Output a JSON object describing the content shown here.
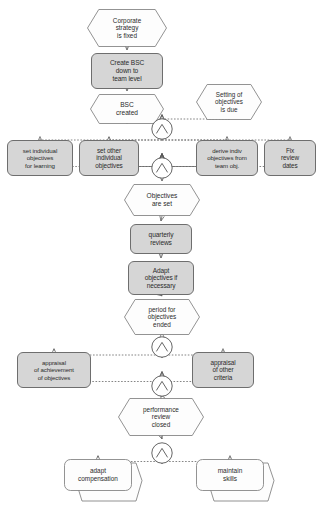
{
  "diagram": {
    "notation": "event-driven-process-chain",
    "canvas": {
      "width": 322,
      "height": 508
    },
    "colors": {
      "background": "#ffffff",
      "event_fill": "#fdfdfd",
      "event_stroke": "#777777",
      "function_fill": "#d6d6d6",
      "function_stroke": "#6e6e6e",
      "process_path_fill": "#fdfdfd",
      "process_path_stroke": "#777777",
      "connector_stroke": "#555555",
      "edge_stroke": "#666666",
      "text": "#2b2b2b"
    },
    "nodes": [
      {
        "id": "e1",
        "type": "event",
        "label": "Corporate\nstrategy\nis fixed",
        "x": 87,
        "y": 9,
        "w": 80,
        "h": 38,
        "font": 6.4
      },
      {
        "id": "f1",
        "type": "function",
        "label": "Create BSC\ndown to\nteam level",
        "x": 91,
        "y": 53,
        "w": 72,
        "h": 36,
        "font": 6.6
      },
      {
        "id": "e2",
        "type": "event",
        "label": "BSC\ncreated",
        "x": 90,
        "y": 94,
        "w": 74,
        "h": 30,
        "font": 6.6
      },
      {
        "id": "e3",
        "type": "event",
        "label": "Setting of\nobjectives\nis due",
        "x": 196,
        "y": 84,
        "w": 66,
        "h": 36,
        "font": 6.3
      },
      {
        "id": "g1",
        "type": "and-gate",
        "label": "AND",
        "x": 151,
        "y": 118,
        "w": 22,
        "h": 22
      },
      {
        "id": "f2",
        "type": "function",
        "label": "set individual\nobjectives\nfor learning",
        "x": 7,
        "y": 140,
        "w": 66,
        "h": 36,
        "font": 6.2
      },
      {
        "id": "f3",
        "type": "function",
        "label": "set other\nindividual\nobjectives",
        "x": 79,
        "y": 140,
        "w": 60,
        "h": 36,
        "font": 6.4
      },
      {
        "id": "f4",
        "type": "function",
        "label": "derive indiv\nobjectives from\nteam obj.",
        "x": 196,
        "y": 140,
        "w": 62,
        "h": 36,
        "font": 6.1
      },
      {
        "id": "f5",
        "type": "function",
        "label": "Fix\nreview\ndates",
        "x": 264,
        "y": 140,
        "w": 52,
        "h": 36,
        "font": 6.4
      },
      {
        "id": "g2",
        "type": "and-gate",
        "label": "AND",
        "x": 151,
        "y": 157,
        "w": 22,
        "h": 22
      },
      {
        "id": "e4",
        "type": "event",
        "label": "Objectives\nare set",
        "x": 124,
        "y": 184,
        "w": 76,
        "h": 32,
        "font": 6.6
      },
      {
        "id": "f6",
        "type": "function",
        "label": "quarterly\nreviews",
        "x": 130,
        "y": 224,
        "w": 62,
        "h": 30,
        "font": 6.6
      },
      {
        "id": "f7",
        "type": "function",
        "label": "Adapt\nobjectives if\nnecessary",
        "x": 128,
        "y": 261,
        "w": 66,
        "h": 34,
        "font": 6.5
      },
      {
        "id": "e5",
        "type": "event",
        "label": "period for\nobjectives\nended",
        "x": 124,
        "y": 299,
        "w": 76,
        "h": 36,
        "font": 6.4
      },
      {
        "id": "g3",
        "type": "and-gate",
        "label": "AND",
        "x": 151,
        "y": 336,
        "w": 22,
        "h": 22
      },
      {
        "id": "f8",
        "type": "function",
        "label": "appraisal\nof achievement\nof objectives",
        "x": 17,
        "y": 352,
        "w": 74,
        "h": 36,
        "font": 6.1
      },
      {
        "id": "f9",
        "type": "function",
        "label": "appraisal\nof other\ncriteria",
        "x": 192,
        "y": 352,
        "w": 62,
        "h": 36,
        "font": 6.4
      },
      {
        "id": "g4",
        "type": "and-gate",
        "label": "AND",
        "x": 151,
        "y": 375,
        "w": 22,
        "h": 22
      },
      {
        "id": "e6",
        "type": "event",
        "label": "performance\nreview\nclosed",
        "x": 118,
        "y": 398,
        "w": 86,
        "h": 38,
        "font": 6.4
      },
      {
        "id": "g5",
        "type": "and-gate",
        "label": "AND",
        "x": 151,
        "y": 442,
        "w": 22,
        "h": 22
      },
      {
        "id": "p1",
        "type": "process-path",
        "label": "adapt\ncompensation",
        "x": 64,
        "y": 459,
        "w": 68,
        "h": 32,
        "font": 6.4
      },
      {
        "id": "p2",
        "type": "process-path",
        "label": "maintain\nskills",
        "x": 196,
        "y": 459,
        "w": 68,
        "h": 32,
        "font": 6.5
      }
    ],
    "edges": [
      {
        "from": "e1",
        "to": "f1",
        "style": "solid"
      },
      {
        "from": "f1",
        "to": "e2",
        "style": "solid"
      },
      {
        "from": "e2",
        "to": "g1",
        "style": "dashed"
      },
      {
        "from": "e3",
        "to": "g1",
        "style": "dashed"
      },
      {
        "from": "g1",
        "to": "f2",
        "style": "dashed"
      },
      {
        "from": "g1",
        "to": "f3",
        "style": "dashed"
      },
      {
        "from": "g1",
        "to": "f4",
        "style": "dashed"
      },
      {
        "from": "g1",
        "to": "f5",
        "style": "dashed"
      },
      {
        "from": "f2",
        "to": "g2",
        "style": "dashed"
      },
      {
        "from": "f3",
        "to": "g2",
        "style": "solid"
      },
      {
        "from": "f4",
        "to": "g2",
        "style": "solid"
      },
      {
        "from": "f5",
        "to": "g2",
        "style": "dashed"
      },
      {
        "from": "g2",
        "to": "e4",
        "style": "solid"
      },
      {
        "from": "e4",
        "to": "f6",
        "style": "solid"
      },
      {
        "from": "f6",
        "to": "f7",
        "style": "solid"
      },
      {
        "from": "f7",
        "to": "e5",
        "style": "solid"
      },
      {
        "from": "e5",
        "to": "g3",
        "style": "solid"
      },
      {
        "from": "g3",
        "to": "f8",
        "style": "dashed"
      },
      {
        "from": "g3",
        "to": "f9",
        "style": "dashed"
      },
      {
        "from": "f8",
        "to": "g4",
        "style": "dashed"
      },
      {
        "from": "f9",
        "to": "g4",
        "style": "dashed"
      },
      {
        "from": "g4",
        "to": "e6",
        "style": "solid"
      },
      {
        "from": "e6",
        "to": "g5",
        "style": "solid"
      },
      {
        "from": "g5",
        "to": "p1",
        "style": "dashed"
      },
      {
        "from": "g5",
        "to": "p2",
        "style": "dashed"
      }
    ]
  }
}
